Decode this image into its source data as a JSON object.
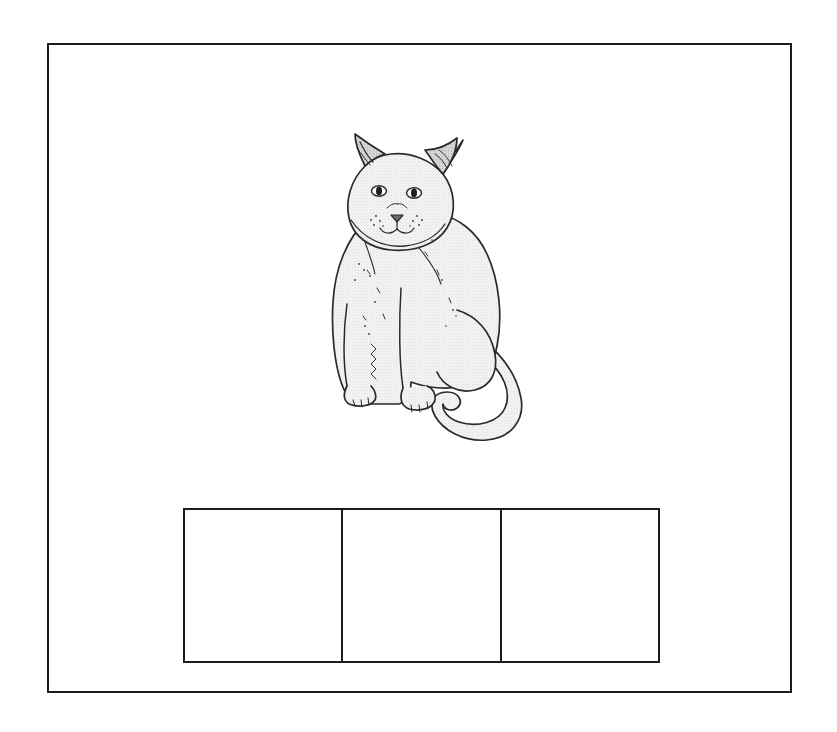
{
  "page": {
    "type": "phonics-worksheet-card",
    "background_color": "#ffffff",
    "frame_border_color": "#1c1c1c"
  },
  "card": {
    "border_color": "#1c1c1c"
  },
  "picture": {
    "subject": "cat",
    "icon_name": "cat-illustration",
    "style": "black-and-white-line-drawing",
    "description": "Seated cat facing forward with long curled tail",
    "outline_color": "#2a2a2a",
    "fill_color": "#f2f2f2",
    "ear_inner_color": "#c9c9c9"
  },
  "answer_boxes": {
    "count": 3,
    "border_color": "#1c1c1c",
    "fill_color": "#ffffff",
    "cells": [
      {
        "index": 1,
        "value": ""
      },
      {
        "index": 2,
        "value": ""
      },
      {
        "index": 3,
        "value": ""
      }
    ]
  }
}
